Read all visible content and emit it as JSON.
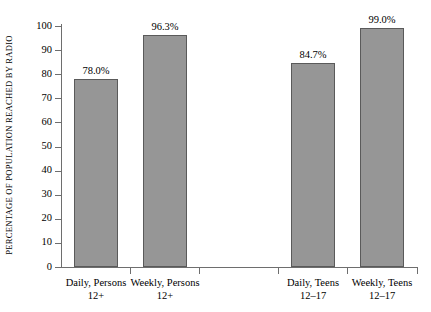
{
  "chart_data": {
    "type": "bar",
    "title": "",
    "xlabel": "",
    "ylabel": "PERCENTAGE OF POPULATION REACHED BY RADIO",
    "ylim": [
      0,
      100
    ],
    "yticks": [
      0,
      10,
      20,
      30,
      40,
      50,
      60,
      70,
      80,
      90,
      100
    ],
    "ytick_labels": [
      "0",
      "10",
      "20",
      "30",
      "40",
      "50",
      "60",
      "70",
      "80",
      "90",
      "100"
    ],
    "grid": false,
    "legend": null,
    "orientation": "vertical",
    "bar_color": "#969696",
    "bar_edge_color": "#5a5a5a",
    "axis_color": "#6e6e6e",
    "categories": [
      "Daily, Persons 12+",
      "Weekly, Persons 12+",
      "Daily, Teens 12–17",
      "Weekly, Teens 12–17"
    ],
    "category_lines": [
      {
        "line1": "Daily, Persons",
        "line2": "12+"
      },
      {
        "line1": "Weekly, Persons",
        "line2": "12+"
      },
      {
        "line1": "Daily, Teens",
        "line2": "12–17"
      },
      {
        "line1": "Weekly, Teens",
        "line2": "12–17"
      }
    ],
    "values": [
      78.0,
      96.3,
      84.7,
      99.0
    ],
    "value_labels": [
      "78.0%",
      "96.3%",
      "84.7%",
      "99.0%"
    ],
    "bars": [
      {
        "label": "Daily, Persons 12+",
        "value": 78.0,
        "value_label": "78.0%",
        "left_px": 74,
        "width_px": 44
      },
      {
        "label": "Weekly, Persons 12+",
        "value": 96.3,
        "value_label": "96.3%",
        "left_px": 143,
        "width_px": 44
      },
      {
        "label": "Daily, Teens 12–17",
        "value": 84.7,
        "value_label": "84.7%",
        "left_px": 291,
        "width_px": 44
      },
      {
        "label": "Weekly, Teens 12–17",
        "value": 99.0,
        "value_label": "99.0%",
        "left_px": 360,
        "width_px": 44
      }
    ]
  }
}
